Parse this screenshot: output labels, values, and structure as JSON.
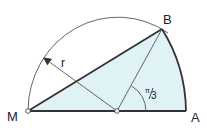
{
  "diagram": {
    "colors": {
      "fill": "#dff3f7",
      "stroke": "#333333",
      "thin": "#555555"
    },
    "points": {
      "M": {
        "label": "M",
        "x": 28,
        "y": 111
      },
      "O": {
        "label": "",
        "x": 117,
        "y": 111
      },
      "A": {
        "label": "A",
        "x": 186,
        "y": 111
      },
      "B": {
        "label": "B",
        "x": 162,
        "y": 29
      }
    },
    "radius_label": "r",
    "angle_label": "π/3",
    "angle_num": "π",
    "angle_den": "3"
  }
}
